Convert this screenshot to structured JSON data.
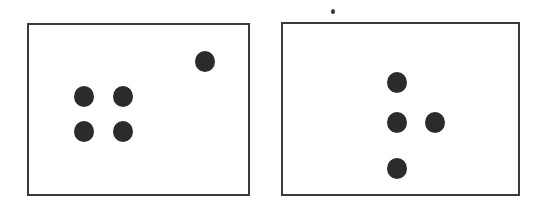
{
  "colors": {
    "border": "#3a3a3a",
    "dot": "#2b2b2b",
    "background": "#ffffff"
  },
  "panels": [
    {
      "id": "left",
      "box": {
        "x": 27,
        "y": 23,
        "w": 223,
        "h": 173
      },
      "dots": [
        {
          "cx": 205,
          "cy": 61,
          "r": 10
        },
        {
          "cx": 84,
          "cy": 96,
          "r": 10
        },
        {
          "cx": 123,
          "cy": 96,
          "r": 10
        },
        {
          "cx": 84,
          "cy": 131,
          "r": 10
        },
        {
          "cx": 123,
          "cy": 131,
          "r": 10
        }
      ]
    },
    {
      "id": "right",
      "box": {
        "x": 281,
        "y": 22,
        "w": 239,
        "h": 174
      },
      "dots": [
        {
          "cx": 397,
          "cy": 82,
          "r": 10
        },
        {
          "cx": 397,
          "cy": 122,
          "r": 10
        },
        {
          "cx": 435,
          "cy": 122,
          "r": 10
        },
        {
          "cx": 397,
          "cy": 168,
          "r": 10
        }
      ]
    }
  ],
  "specks": [
    {
      "cx": 333,
      "cy": 11,
      "r": 2
    }
  ]
}
